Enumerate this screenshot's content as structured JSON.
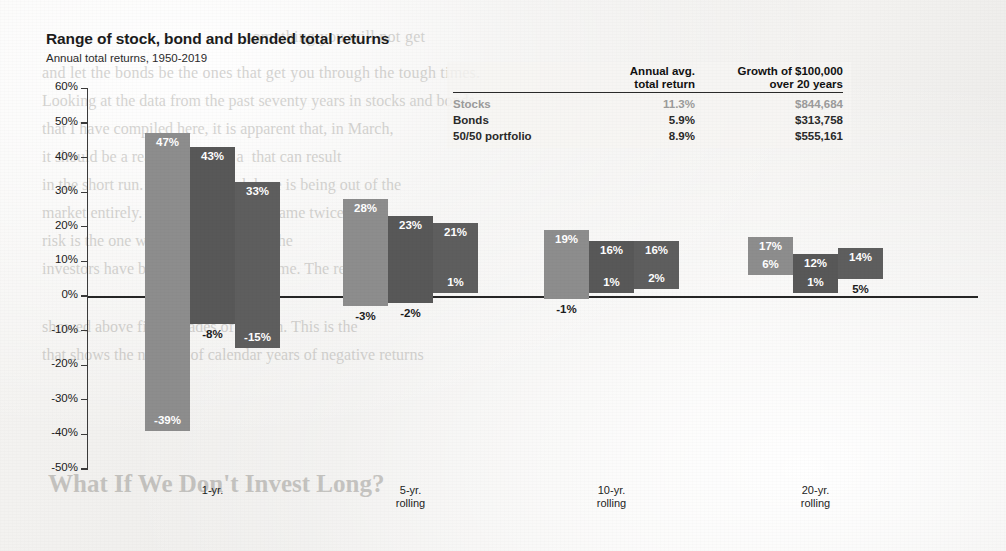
{
  "chart_data": {
    "type": "bar",
    "title": "Range of stock, bond and blended total returns",
    "subtitle": "Annual total returns, 1950-2019",
    "xlabel": "",
    "ylabel": "",
    "ylim": [
      -50,
      60
    ],
    "ytick_labels": [
      "60%",
      "50%",
      "40%",
      "30%",
      "20%",
      "10%",
      "0%",
      "-10%",
      "-20%",
      "-30%",
      "-40%",
      "-50%"
    ],
    "ytick_values": [
      60,
      50,
      40,
      30,
      20,
      10,
      0,
      -10,
      -20,
      -30,
      -40,
      -50
    ],
    "grid": false,
    "legend_position": "top-right",
    "categories": [
      "1-yr.",
      "5-yr.\nrolling",
      "10-yr.\nrolling",
      "20-yr.\nrolling"
    ],
    "category_labels": [
      {
        "line1": "1-yr.",
        "line2": ""
      },
      {
        "line1": "5-yr.",
        "line2": "rolling"
      },
      {
        "line1": "10-yr.",
        "line2": "rolling"
      },
      {
        "line1": "20-yr.",
        "line2": "rolling"
      }
    ],
    "series": [
      {
        "name": "Stocks",
        "color": "#8d8d8d",
        "max_values": [
          47,
          28,
          19,
          17
        ],
        "min_values": [
          -39,
          -3,
          -1,
          6
        ],
        "max_labels": [
          "47%",
          "28%",
          "19%",
          "17%"
        ],
        "min_labels": [
          "-39%",
          "-3%",
          "-1%",
          "6%"
        ]
      },
      {
        "name": "Bonds",
        "color": "#585858",
        "max_values": [
          43,
          23,
          16,
          12
        ],
        "min_values": [
          -8,
          -2,
          1,
          1
        ],
        "max_labels": [
          "43%",
          "23%",
          "16%",
          "12%"
        ],
        "min_labels": [
          "-8%",
          "-2%",
          "1%",
          "1%"
        ]
      },
      {
        "name": "50/50 portfolio",
        "color": "#5e5e5e",
        "max_values": [
          33,
          21,
          16,
          14
        ],
        "min_values": [
          -15,
          1,
          2,
          5
        ],
        "max_labels": [
          "33%",
          "21%",
          "16%",
          "14%"
        ],
        "min_labels": [
          "-15%",
          "1%",
          "2%",
          "5%"
        ]
      }
    ]
  },
  "legend_table": {
    "header": {
      "col1_line1": "Annual avg.",
      "col1_line2": "total return",
      "col2_line1": "Growth of $100,000",
      "col2_line2": "over 20 years"
    },
    "rows": [
      {
        "name": "Stocks",
        "avg": "11.3%",
        "growth": "$844,684"
      },
      {
        "name": "Bonds",
        "avg": "5.9%",
        "growth": "$313,758"
      },
      {
        "name": "50/50 portfolio",
        "avg": "8.9%",
        "growth": "$555,161"
      }
    ]
  },
  "background_text": {
    "b1": "something you will not get",
    "b2": "and let the bonds be the ones that get you through the tough times.",
    "b3": "Looking at the data from the past seventy years in stocks and bonds",
    "b4": "that I have compiled here, it is apparent that, in March,",
    "b5": "it should be a real  rather than a  that can result",
    "b6": "in the short run. But the real risk here is being out of the",
    "b7": "market entirely. Nothing is ever the same twice.",
    "b8": "risk is the one we all face together. The",
    "b9": "investors have been rewarded over time. The returns",
    "b10": "showed above five decades of growth. This is the",
    "b11": "that shows the number of calendar years of negative returns",
    "b12": "",
    "big": "What If We Don't Invest Long?"
  }
}
